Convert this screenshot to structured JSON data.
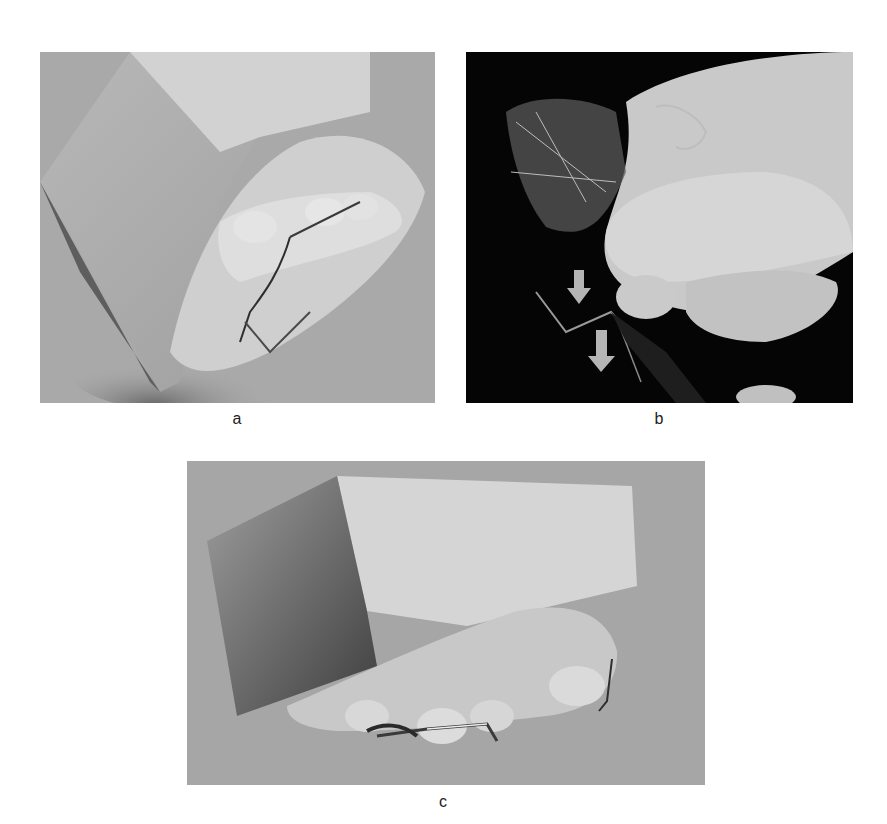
{
  "figure": {
    "panels": [
      {
        "id": "a",
        "label": "a",
        "description": "Dental plaster cast with wire clasp appliance on occlusal surface, viewed from angle, grey background"
      },
      {
        "id": "b",
        "label": "b",
        "description": "Gloved hand holding clear thermoformed appliance with wire components; two grey arrows pointing downward against black background"
      },
      {
        "id": "c",
        "label": "c",
        "description": "Dental plaster cast side view with wire clasp attached to teeth, grey background"
      }
    ],
    "annotations": {
      "panel_b_arrows": 2,
      "arrow_direction": "down",
      "arrow_color": "#b5b5b5"
    },
    "colors": {
      "background": "#ffffff",
      "photo_bg_a": "#a9a9a9",
      "photo_bg_b": "#050505",
      "photo_bg_c": "#a6a6a6",
      "plaster": "#d8d8d8",
      "glove": "#c9c9c9"
    }
  }
}
